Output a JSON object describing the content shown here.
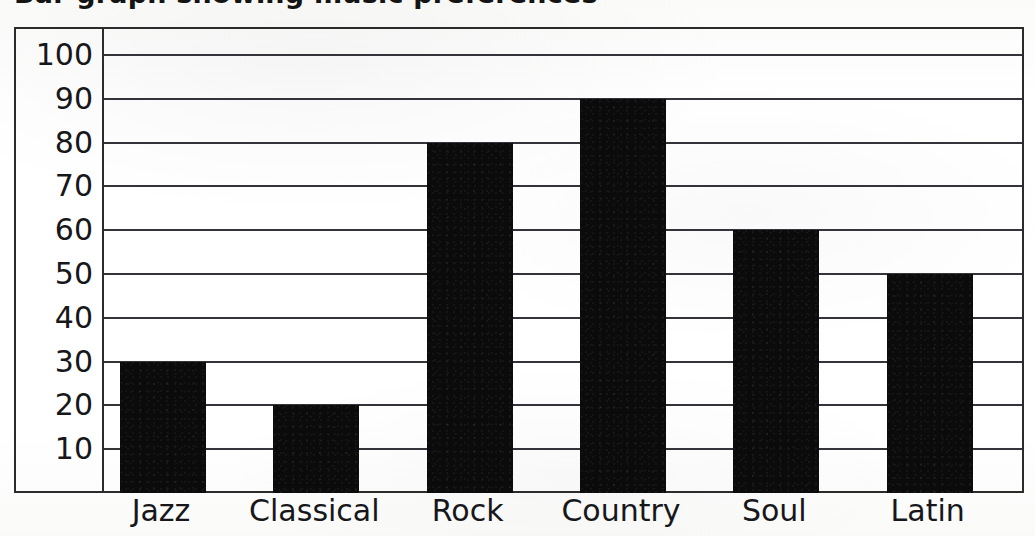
{
  "chart_data": {
    "type": "bar",
    "title": "Bar graph showing music preferences",
    "categories": [
      "Jazz",
      "Classical",
      "Rock",
      "Country",
      "Soul",
      "Latin"
    ],
    "values": [
      30,
      20,
      80,
      90,
      60,
      50
    ],
    "xlabel": "",
    "ylabel": "",
    "ylim": [
      0,
      105
    ],
    "y_ticks": [
      100,
      90,
      80,
      70,
      60,
      50,
      40,
      30,
      20,
      10
    ],
    "y_tick_labels": [
      "100",
      "90",
      "80",
      "70",
      "60",
      "50",
      "40",
      "30",
      "20",
      "10"
    ],
    "grid": true,
    "grid_axis": "y",
    "legend": false,
    "bar_color": "#0b0b0b",
    "frame_color": "#2b2b2b",
    "background_color": "#ffffff"
  },
  "chart": {
    "title_visible_fragment": "Bar graph showing music preferences",
    "y_axis": {
      "name": "y-axis",
      "ticks": [
        {
          "label": "100",
          "value": 100
        },
        {
          "label": "90",
          "value": 90
        },
        {
          "label": "80",
          "value": 80
        },
        {
          "label": "70",
          "value": 70
        },
        {
          "label": "60",
          "value": 60
        },
        {
          "label": "50",
          "value": 50
        },
        {
          "label": "40",
          "value": 40
        },
        {
          "label": "30",
          "value": 30
        },
        {
          "label": "20",
          "value": 20
        },
        {
          "label": "10",
          "value": 10
        }
      ]
    },
    "x_axis": {
      "name": "x-axis",
      "ticks": [
        {
          "label": "Jazz",
          "value": 30
        },
        {
          "label": "Classical",
          "value": 20
        },
        {
          "label": "Rock",
          "value": 80
        },
        {
          "label": "Country",
          "value": 90
        },
        {
          "label": "Soul",
          "value": 60
        },
        {
          "label": "Latin",
          "value": 50
        }
      ]
    },
    "bars": [
      {
        "label": "Jazz",
        "value": 30
      },
      {
        "label": "Classical",
        "value": 20
      },
      {
        "label": "Rock",
        "value": 80
      },
      {
        "label": "Country",
        "value": 90
      },
      {
        "label": "Soul",
        "value": 60
      },
      {
        "label": "Latin",
        "value": 50
      }
    ]
  }
}
